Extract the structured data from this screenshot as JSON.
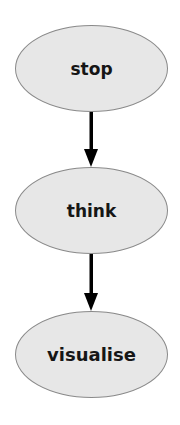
{
  "diagram": {
    "type": "vertical-flowchart",
    "nodes": [
      {
        "id": "stop",
        "label": "stop",
        "shape": "ellipse"
      },
      {
        "id": "think",
        "label": "think",
        "shape": "ellipse"
      },
      {
        "id": "visualise",
        "label": "visualise",
        "shape": "ellipse"
      }
    ],
    "edges": [
      {
        "from": "stop",
        "to": "think",
        "direction": "down"
      },
      {
        "from": "think",
        "to": "visualise",
        "direction": "down"
      }
    ],
    "colors": {
      "node_fill": "#e7e7e7",
      "node_stroke": "#8a8a8a",
      "label_text": "#161616",
      "arrow": "#000000",
      "background": "#ffffff"
    }
  }
}
